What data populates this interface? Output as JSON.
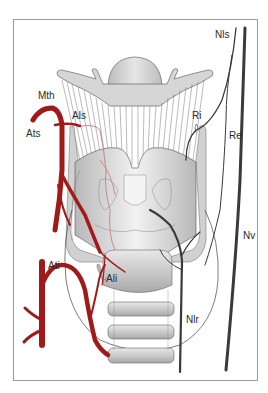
{
  "figure": {
    "type": "anatomical-diagram",
    "colors": {
      "artery": "#a11a1a",
      "artery_light": "#c98a8a",
      "nerve": "#3a3a3a",
      "cartilage_fill": "#d9d9d9",
      "cartilage_dark": "#b5b5b5",
      "outline": "#555555",
      "frame": "#9a9a9a"
    },
    "labels": {
      "nls": "Nls",
      "mth": "Mth",
      "als": "Als",
      "ri": "Ri",
      "ats": "Ats",
      "re": "Re",
      "nv": "Nv",
      "ati": "Ati",
      "ali": "Ali",
      "nlr": "Nlr"
    }
  }
}
